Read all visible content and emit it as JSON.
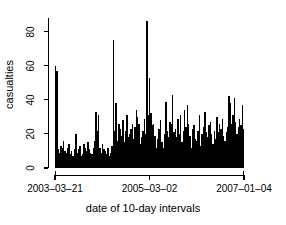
{
  "chart_data": {
    "type": "bar",
    "title": "",
    "subtitle": "",
    "xlabel": "date of 10-day intervals",
    "ylabel": "casualties",
    "grid": false,
    "legend": null,
    "ylim": [
      0,
      88
    ],
    "yticks": [
      0,
      20,
      40,
      60,
      80
    ],
    "ytick_labels": [
      "0",
      "20",
      "40",
      "60",
      "80"
    ],
    "xticks": [
      0,
      70,
      140
    ],
    "xtick_labels": [
      "2003–03–21",
      "2005–03–02",
      "2007–01–04"
    ],
    "x_axis_kind": "date-10-day-intervals",
    "n_points": 141,
    "max_value": 86,
    "min_value": 1,
    "values": [
      60,
      57,
      11,
      9,
      13,
      12,
      16,
      10,
      9,
      12,
      14,
      8,
      10,
      7,
      11,
      20,
      9,
      11,
      13,
      7,
      8,
      14,
      12,
      10,
      15,
      11,
      9,
      8,
      12,
      16,
      33,
      22,
      31,
      12,
      9,
      14,
      11,
      10,
      8,
      12,
      7,
      9,
      13,
      75,
      22,
      38,
      16,
      26,
      23,
      19,
      28,
      15,
      22,
      31,
      18,
      20,
      23,
      26,
      17,
      24,
      34,
      30,
      26,
      14,
      18,
      22,
      29,
      20,
      86,
      31,
      53,
      32,
      25,
      26,
      19,
      12,
      17,
      23,
      28,
      15,
      12,
      20,
      39,
      22,
      18,
      27,
      26,
      43,
      21,
      23,
      18,
      29,
      20,
      31,
      15,
      22,
      34,
      24,
      37,
      26,
      19,
      12,
      23,
      25,
      17,
      16,
      22,
      31,
      13,
      20,
      24,
      33,
      21,
      18,
      25,
      27,
      20,
      14,
      22,
      17,
      30,
      21,
      26,
      23,
      29,
      19,
      16,
      21,
      24,
      42,
      38,
      26,
      31,
      41,
      27,
      20,
      24,
      29,
      25,
      37,
      23
    ]
  }
}
